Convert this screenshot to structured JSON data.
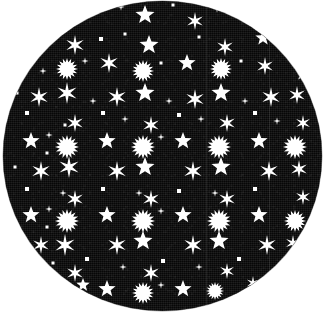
{
  "swatch": {
    "shape": "circle",
    "diameter_px": 319,
    "center": {
      "x": 162,
      "y": 156
    },
    "background_color": "#ffffff",
    "fabric_color": "#0c0c0c",
    "print_color": "#ffffff",
    "material_look": "woven-textured-fabric",
    "pattern_name": "stars-on-black",
    "seam_lines_x": [
      203,
      266
    ]
  },
  "pattern": {
    "grid_period_x": 38,
    "grid_period_y": 38,
    "motif_types": [
      "six-point-star",
      "sunburst",
      "five-point-star",
      "small-dot",
      "tiny-sparkle"
    ],
    "motifs": [
      {
        "t": "six",
        "x": 36,
        "y": -2,
        "s": 9
      },
      {
        "t": "dot",
        "x": 62,
        "y": 12,
        "s": 3
      },
      {
        "t": "six",
        "x": 90,
        "y": -4,
        "s": 8
      },
      {
        "t": "five",
        "x": 142,
        "y": 14,
        "s": 10
      },
      {
        "t": "tiny",
        "x": 118,
        "y": 6,
        "s": 3
      },
      {
        "t": "six",
        "x": 192,
        "y": 20,
        "s": 9
      },
      {
        "t": "dot",
        "x": 170,
        "y": 4,
        "s": 3
      },
      {
        "t": "five",
        "x": 240,
        "y": 2,
        "s": 8
      },
      {
        "t": "tiny",
        "x": 214,
        "y": 8,
        "s": 3
      },
      {
        "t": "six",
        "x": 268,
        "y": 16,
        "s": 7
      },
      {
        "t": "dot",
        "x": 98,
        "y": 38,
        "s": 4
      },
      {
        "t": "six",
        "x": 72,
        "y": 44,
        "s": 10
      },
      {
        "t": "five",
        "x": 146,
        "y": 44,
        "s": 10
      },
      {
        "t": "dot",
        "x": 122,
        "y": 33,
        "s": 3
      },
      {
        "t": "six",
        "x": 222,
        "y": 46,
        "s": 9
      },
      {
        "t": "dot",
        "x": 196,
        "y": 36,
        "s": 3
      },
      {
        "t": "five",
        "x": 260,
        "y": 37,
        "s": 8
      },
      {
        "t": "six",
        "x": 290,
        "y": 52,
        "s": 7
      },
      {
        "t": "dot",
        "x": 46,
        "y": 35,
        "s": 3
      },
      {
        "t": "five",
        "x": 18,
        "y": 56,
        "s": 7
      },
      {
        "t": "sun",
        "x": 64,
        "y": 68,
        "s": 11
      },
      {
        "t": "tiny",
        "x": 82,
        "y": 60,
        "s": 3
      },
      {
        "t": "six",
        "x": 106,
        "y": 62,
        "s": 10
      },
      {
        "t": "dot",
        "x": 158,
        "y": 62,
        "s": 3
      },
      {
        "t": "sun",
        "x": 140,
        "y": 70,
        "s": 11
      },
      {
        "t": "five",
        "x": 184,
        "y": 62,
        "s": 9
      },
      {
        "t": "sun",
        "x": 218,
        "y": 68,
        "s": 11
      },
      {
        "t": "dot",
        "x": 238,
        "y": 60,
        "s": 3
      },
      {
        "t": "six",
        "x": 262,
        "y": 65,
        "s": 9
      },
      {
        "t": "five",
        "x": 300,
        "y": 72,
        "s": 8
      },
      {
        "t": "tiny",
        "x": 40,
        "y": 70,
        "s": 3
      },
      {
        "t": "six",
        "x": 36,
        "y": 96,
        "s": 10
      },
      {
        "t": "six",
        "x": 64,
        "y": 92,
        "s": 11
      },
      {
        "t": "six",
        "x": 114,
        "y": 96,
        "s": 10
      },
      {
        "t": "five",
        "x": 142,
        "y": 92,
        "s": 10
      },
      {
        "t": "six",
        "x": 192,
        "y": 98,
        "s": 10
      },
      {
        "t": "five",
        "x": 218,
        "y": 92,
        "s": 10
      },
      {
        "t": "six",
        "x": 268,
        "y": 96,
        "s": 10
      },
      {
        "t": "six",
        "x": 294,
        "y": 94,
        "s": 9
      },
      {
        "t": "tiny",
        "x": 90,
        "y": 100,
        "s": 3
      },
      {
        "t": "tiny",
        "x": 166,
        "y": 100,
        "s": 3
      },
      {
        "t": "tiny",
        "x": 242,
        "y": 100,
        "s": 3
      },
      {
        "t": "dot",
        "x": 14,
        "y": 92,
        "s": 3
      },
      {
        "t": "dot",
        "x": 24,
        "y": 112,
        "s": 4
      },
      {
        "t": "dot",
        "x": 100,
        "y": 112,
        "s": 4
      },
      {
        "t": "dot",
        "x": 176,
        "y": 114,
        "s": 4
      },
      {
        "t": "dot",
        "x": 252,
        "y": 112,
        "s": 4
      },
      {
        "t": "dot",
        "x": 62,
        "y": 124,
        "s": 3
      },
      {
        "t": "six",
        "x": 72,
        "y": 122,
        "s": 9
      },
      {
        "t": "six",
        "x": 148,
        "y": 124,
        "s": 9
      },
      {
        "t": "six",
        "x": 224,
        "y": 122,
        "s": 9
      },
      {
        "t": "six",
        "x": 300,
        "y": 122,
        "s": 8
      },
      {
        "t": "tiny",
        "x": 122,
        "y": 118,
        "s": 3
      },
      {
        "t": "tiny",
        "x": 198,
        "y": 118,
        "s": 3
      },
      {
        "t": "tiny",
        "x": 274,
        "y": 120,
        "s": 3
      },
      {
        "t": "five",
        "x": 28,
        "y": 140,
        "s": 9
      },
      {
        "t": "tiny",
        "x": 46,
        "y": 134,
        "s": 3
      },
      {
        "t": "sun",
        "x": 64,
        "y": 146,
        "s": 12
      },
      {
        "t": "five",
        "x": 104,
        "y": 140,
        "s": 9
      },
      {
        "t": "sun",
        "x": 140,
        "y": 146,
        "s": 12
      },
      {
        "t": "tiny",
        "x": 158,
        "y": 136,
        "s": 3
      },
      {
        "t": "five",
        "x": 180,
        "y": 140,
        "s": 9
      },
      {
        "t": "sun",
        "x": 216,
        "y": 146,
        "s": 12
      },
      {
        "t": "five",
        "x": 256,
        "y": 140,
        "s": 9
      },
      {
        "t": "sun",
        "x": 292,
        "y": 146,
        "s": 12
      },
      {
        "t": "dot",
        "x": 44,
        "y": 152,
        "s": 3
      },
      {
        "t": "six",
        "x": 38,
        "y": 170,
        "s": 10
      },
      {
        "t": "six",
        "x": 66,
        "y": 166,
        "s": 11
      },
      {
        "t": "six",
        "x": 114,
        "y": 170,
        "s": 10
      },
      {
        "t": "five",
        "x": 142,
        "y": 166,
        "s": 10
      },
      {
        "t": "six",
        "x": 190,
        "y": 170,
        "s": 10
      },
      {
        "t": "five",
        "x": 218,
        "y": 166,
        "s": 10
      },
      {
        "t": "six",
        "x": 266,
        "y": 170,
        "s": 10
      },
      {
        "t": "six",
        "x": 296,
        "y": 168,
        "s": 9
      },
      {
        "t": "dot",
        "x": 12,
        "y": 166,
        "s": 3
      },
      {
        "t": "dot",
        "x": 24,
        "y": 188,
        "s": 4
      },
      {
        "t": "dot",
        "x": 100,
        "y": 188,
        "s": 4
      },
      {
        "t": "dot",
        "x": 176,
        "y": 190,
        "s": 4
      },
      {
        "t": "dot",
        "x": 252,
        "y": 188,
        "s": 4
      },
      {
        "t": "six",
        "x": 72,
        "y": 198,
        "s": 9
      },
      {
        "t": "six",
        "x": 148,
        "y": 198,
        "s": 9
      },
      {
        "t": "six",
        "x": 224,
        "y": 198,
        "s": 9
      },
      {
        "t": "six",
        "x": 300,
        "y": 196,
        "s": 8
      },
      {
        "t": "tiny",
        "x": 60,
        "y": 192,
        "s": 3
      },
      {
        "t": "tiny",
        "x": 136,
        "y": 192,
        "s": 3
      },
      {
        "t": "tiny",
        "x": 212,
        "y": 192,
        "s": 3
      },
      {
        "t": "five",
        "x": 28,
        "y": 214,
        "s": 9
      },
      {
        "t": "sun",
        "x": 64,
        "y": 220,
        "s": 12
      },
      {
        "t": "five",
        "x": 104,
        "y": 214,
        "s": 9
      },
      {
        "t": "sun",
        "x": 140,
        "y": 220,
        "s": 12
      },
      {
        "t": "five",
        "x": 180,
        "y": 214,
        "s": 9
      },
      {
        "t": "sun",
        "x": 216,
        "y": 220,
        "s": 12
      },
      {
        "t": "five",
        "x": 256,
        "y": 214,
        "s": 9
      },
      {
        "t": "sun",
        "x": 292,
        "y": 220,
        "s": 11
      },
      {
        "t": "tiny",
        "x": 46,
        "y": 208,
        "s": 3
      },
      {
        "t": "tiny",
        "x": 158,
        "y": 210,
        "s": 3
      },
      {
        "t": "dot",
        "x": 44,
        "y": 226,
        "s": 3
      },
      {
        "t": "six",
        "x": 62,
        "y": 244,
        "s": 11
      },
      {
        "t": "five",
        "x": 140,
        "y": 240,
        "s": 10
      },
      {
        "t": "six",
        "x": 114,
        "y": 244,
        "s": 10
      },
      {
        "t": "six",
        "x": 190,
        "y": 244,
        "s": 10
      },
      {
        "t": "five",
        "x": 216,
        "y": 240,
        "s": 10
      },
      {
        "t": "six",
        "x": 264,
        "y": 244,
        "s": 10
      },
      {
        "t": "six",
        "x": 38,
        "y": 244,
        "s": 9
      },
      {
        "t": "six",
        "x": 290,
        "y": 242,
        "s": 8
      },
      {
        "t": "dot",
        "x": 84,
        "y": 258,
        "s": 4
      },
      {
        "t": "dot",
        "x": 160,
        "y": 260,
        "s": 4
      },
      {
        "t": "dot",
        "x": 236,
        "y": 258,
        "s": 4
      },
      {
        "t": "six",
        "x": 72,
        "y": 272,
        "s": 9
      },
      {
        "t": "six",
        "x": 148,
        "y": 272,
        "s": 9
      },
      {
        "t": "six",
        "x": 224,
        "y": 270,
        "s": 8
      },
      {
        "t": "tiny",
        "x": 120,
        "y": 266,
        "s": 3
      },
      {
        "t": "tiny",
        "x": 196,
        "y": 266,
        "s": 3
      },
      {
        "t": "dot",
        "x": 50,
        "y": 262,
        "s": 3
      },
      {
        "t": "five",
        "x": 104,
        "y": 288,
        "s": 9
      },
      {
        "t": "sun",
        "x": 140,
        "y": 292,
        "s": 11
      },
      {
        "t": "five",
        "x": 180,
        "y": 288,
        "s": 9
      },
      {
        "t": "sun",
        "x": 212,
        "y": 290,
        "s": 9
      },
      {
        "t": "five",
        "x": 80,
        "y": 284,
        "s": 7
      },
      {
        "t": "tiny",
        "x": 158,
        "y": 284,
        "s": 3
      },
      {
        "t": "six",
        "x": 250,
        "y": 282,
        "s": 7
      }
    ]
  }
}
